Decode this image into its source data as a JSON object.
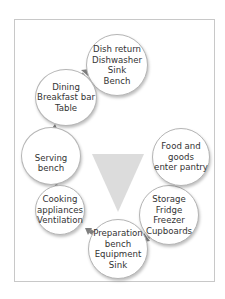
{
  "diagram": {
    "nodes": [
      {
        "id": "dish-return",
        "lines": [
          "Dish return",
          "Dishwasher",
          "Sink",
          "Bench"
        ]
      },
      {
        "id": "dining",
        "lines": [
          "Dining",
          "Breakfast bar",
          "Table"
        ]
      },
      {
        "id": "serving",
        "lines": [
          "Serving",
          "bench"
        ]
      },
      {
        "id": "cooking",
        "lines": [
          "Cooking",
          "appliances",
          "Ventilation"
        ]
      },
      {
        "id": "preparation",
        "lines": [
          "Preparation",
          "bench",
          "Equipment",
          "Sink"
        ]
      },
      {
        "id": "storage",
        "lines": [
          "Storage",
          "Fridge",
          "Freezer",
          "Cupboards"
        ]
      },
      {
        "id": "food-goods",
        "lines": [
          "Food and",
          "goods",
          "enter pantry"
        ]
      }
    ],
    "flow": [
      "food-goods",
      "storage",
      "preparation",
      "cooking",
      "serving",
      "dining",
      "dish-return"
    ],
    "colors": {
      "arrow": "#7f7f7f",
      "triangle": "#dcdcdc",
      "border": "#b5b5b5"
    }
  }
}
